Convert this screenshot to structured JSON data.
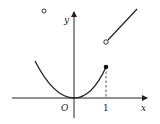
{
  "diagram": {
    "title": "",
    "axes": {
      "x_label": "x",
      "y_label": "y",
      "origin_label": "O",
      "x_tick_label": "1"
    },
    "pieces": [
      {
        "name": "parabola",
        "description": "y = x^2 on x <= 1",
        "endpoint": "filled dot at (1, 1)"
      },
      {
        "name": "ray",
        "description": "increasing line for x > 1",
        "endpoint": "open circle at (1, 2)"
      },
      {
        "name": "isolated-open-point",
        "description": "open circle in upper-left quadrant"
      }
    ],
    "colors": {
      "stroke": "#222222",
      "background": "#ffffff"
    }
  }
}
